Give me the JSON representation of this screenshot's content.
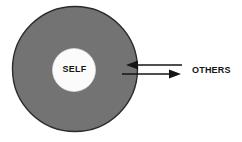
{
  "diagram": {
    "background_color": "#ffffff",
    "outer_circle": {
      "name": "outer-circle",
      "fill_color": "#737373",
      "stroke_color": "#2b2b2b",
      "center_x": 75,
      "center_y": 69,
      "radius": 63
    },
    "inner_circle": {
      "name": "inner-circle",
      "label": "SELF",
      "fill_color": "#fbfbfb",
      "center_x": 74,
      "center_y": 70,
      "radius": 21.5
    },
    "arrows": [
      {
        "name": "arrow-inward",
        "label": "",
        "direction": "left",
        "color": "#151515",
        "x_start": 182,
        "x_end": 126,
        "y": 65
      },
      {
        "name": "arrow-outward",
        "label": "",
        "direction": "right",
        "color": "#151515",
        "x_start": 122,
        "x_end": 181,
        "y": 74
      }
    ],
    "others_label": "OTHERS"
  }
}
